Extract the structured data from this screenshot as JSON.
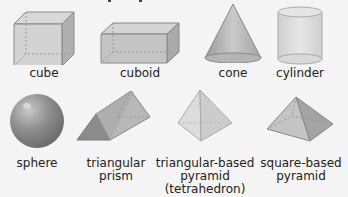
{
  "figure": {
    "shapes": [
      {
        "name": "cube",
        "label_lines": [
          "cube"
        ]
      },
      {
        "name": "cuboid",
        "label_lines": [
          "cuboid"
        ]
      },
      {
        "name": "cone",
        "label_lines": [
          "cone"
        ]
      },
      {
        "name": "cylinder",
        "label_lines": [
          "cylinder"
        ]
      },
      {
        "name": "sphere",
        "label_lines": [
          "sphere"
        ]
      },
      {
        "name": "triangular-prism",
        "label_lines": [
          "triangular",
          "prism"
        ]
      },
      {
        "name": "tetrahedron",
        "label_lines": [
          "triangular-based",
          "pyramid",
          "(tetrahedron)"
        ]
      },
      {
        "name": "square-based-pyramid",
        "label_lines": [
          "square-based",
          "pyramid"
        ]
      }
    ],
    "colors": {
      "background": "#f4f4f4",
      "shape_fill": "#c8c8c8",
      "shape_edge": "#888888",
      "text": "#222222"
    }
  }
}
